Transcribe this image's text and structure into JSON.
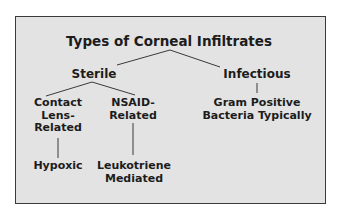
{
  "diagram": {
    "title": "Types of Corneal Infiltrates",
    "colors": {
      "background": "#e3e3e3",
      "border": "#3a3a3a",
      "text": "#1c1c1c",
      "connector": "#3a3a3a"
    },
    "nodes": {
      "root": {
        "label": "Types of Corneal Infiltrates"
      },
      "sterile": {
        "label": "Sterile"
      },
      "infectious": {
        "label": "Infectious"
      },
      "contact_lens": {
        "lines": [
          "Contact",
          "Lens-",
          "Related"
        ]
      },
      "nsaid": {
        "lines": [
          "NSAID-",
          "Related"
        ]
      },
      "gram_positive": {
        "lines": [
          "Gram Positive",
          "Bacteria Typically"
        ]
      },
      "hypoxic": {
        "label": "Hypoxic"
      },
      "leukotriene": {
        "lines": [
          "Leukotriene",
          "Mediated"
        ]
      }
    },
    "edges": [
      {
        "from": "root",
        "to": "sterile"
      },
      {
        "from": "root",
        "to": "infectious"
      },
      {
        "from": "sterile",
        "to": "contact_lens"
      },
      {
        "from": "sterile",
        "to": "nsaid"
      },
      {
        "from": "infectious",
        "to": "gram_positive"
      },
      {
        "from": "contact_lens",
        "to": "hypoxic"
      },
      {
        "from": "nsaid",
        "to": "leukotriene"
      }
    ]
  }
}
